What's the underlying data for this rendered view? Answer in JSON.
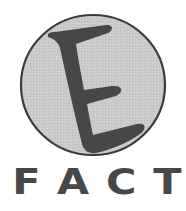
{
  "logo": {
    "emblem_letter": "E",
    "wordmark": "FACT",
    "wordmark_letters": [
      "F",
      "A",
      "C",
      "T"
    ],
    "colors": {
      "background": "#ffffff",
      "circle_fill": "#c9c9c9",
      "circle_outline": "#3c3c3c",
      "letter_fill": "#474747",
      "wordmark": "#474747"
    },
    "icons": [
      "e-letter-emblem-icon"
    ]
  }
}
